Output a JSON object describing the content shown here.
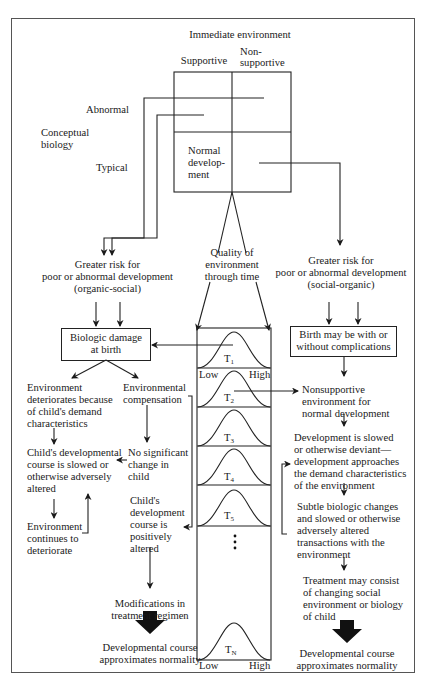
{
  "figure": {
    "header": {
      "title": "Immediate environment",
      "col_supportive": "Supportive",
      "col_nonsupportive_1": "Non-",
      "col_nonsupportive_2": "supportive"
    },
    "row_labels": {
      "abnormal": "Abnormal",
      "conceptual_1": "Conceptual",
      "conceptual_2": "biology",
      "typical": "Typical"
    },
    "grid_cell": {
      "line1": "Normal",
      "line2": "develop-",
      "line3": "ment"
    },
    "quality": {
      "line1": "Quality of",
      "line2": "environment",
      "line3": "through time"
    },
    "left_risk": {
      "line1": "Greater risk for",
      "line2": "poor or abnormal development",
      "line3": "(organic-social)"
    },
    "right_risk": {
      "line1": "Greater risk for",
      "line2": "poor or abnormal development",
      "line3": "(social-organic)"
    },
    "left_box": {
      "line1": "Biologic damage",
      "line2": "at birth"
    },
    "right_box": {
      "line1": "Birth may be with or",
      "line2": "without complications"
    },
    "left_branch": {
      "env_deteriorates": [
        "Environment",
        "deteriorates because",
        "of child's demand",
        "characteristics"
      ],
      "child_slowed": [
        "Child's developmental",
        "course is slowed or",
        "otherwise adversely",
        "altered"
      ],
      "env_continues": [
        "Environment",
        "continues to",
        "deteriorate"
      ],
      "env_compensation": [
        "Environmental",
        "compensation"
      ],
      "no_change": [
        "No significant",
        "change in",
        "child"
      ],
      "positively_altered": [
        "Child's",
        "development",
        "course is",
        "positively",
        "altered"
      ],
      "modifications": [
        "Modifications in",
        "treatment regimen"
      ],
      "outcome": [
        "Developmental course",
        "approximates normality"
      ]
    },
    "right_branch": {
      "nonsupportive": [
        "Nonsupportive",
        "environment for",
        "normal development"
      ],
      "slowed": [
        "Development is slowed",
        "or otherwise deviant—",
        "development approaches",
        "the demand characteristics",
        "of the environment"
      ],
      "subtle": [
        "Subtle biologic changes",
        "and slowed or otherwise",
        "adversely altered",
        "transactions with the",
        "environment"
      ],
      "treatment": [
        "Treatment may consist",
        "of changing social",
        "environment or biology",
        "of child"
      ],
      "outcome": [
        "Developmental course",
        "approximates normality"
      ]
    },
    "timeline": {
      "low": "Low",
      "high": "High",
      "t1": "T",
      "t1_sub": "1",
      "t2": "T",
      "t2_sub": "2",
      "t3": "T",
      "t3_sub": "3",
      "t4": "T",
      "t4_sub": "4",
      "t5": "T",
      "t5_sub": "5",
      "tn": "T",
      "tn_sub": "N",
      "ellipsis": "⋮"
    }
  }
}
